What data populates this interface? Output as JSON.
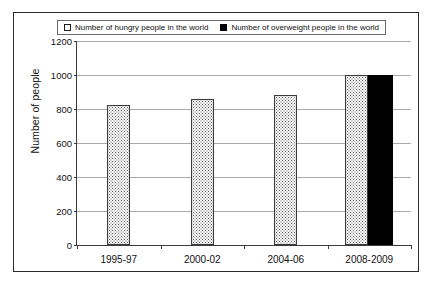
{
  "chart_data": {
    "type": "bar",
    "title": "",
    "xlabel": "",
    "ylabel": "Number of people",
    "ylim": [
      0,
      1200
    ],
    "yticks": [
      0,
      200,
      400,
      600,
      800,
      1000,
      1200
    ],
    "ytick_labels": [
      "0",
      "200",
      "400",
      "600",
      "800",
      "1000",
      "1200"
    ],
    "categories": [
      "1995-97",
      "2000-02",
      "2004-06",
      "2008-2009"
    ],
    "grid": "horizontal",
    "legend_position": "top",
    "series": [
      {
        "name": "Number of hungry people in the world",
        "marker": "hollow-square",
        "fill": "dotted",
        "color": "#ffffff",
        "values": [
          825,
          860,
          880,
          1000
        ]
      },
      {
        "name": "Number of overweight people in the world",
        "marker": "filled-square",
        "fill": "solid",
        "color": "#000000",
        "values": [
          null,
          null,
          null,
          1000
        ]
      }
    ]
  },
  "legend": {
    "entries": [
      {
        "label": "Number of hungry people in the world",
        "swatch": "hollow-square-icon"
      },
      {
        "label": "Number of overweight people in the world",
        "swatch": "filled-square-icon"
      }
    ]
  },
  "axes": {
    "y_title": "Number of people"
  }
}
